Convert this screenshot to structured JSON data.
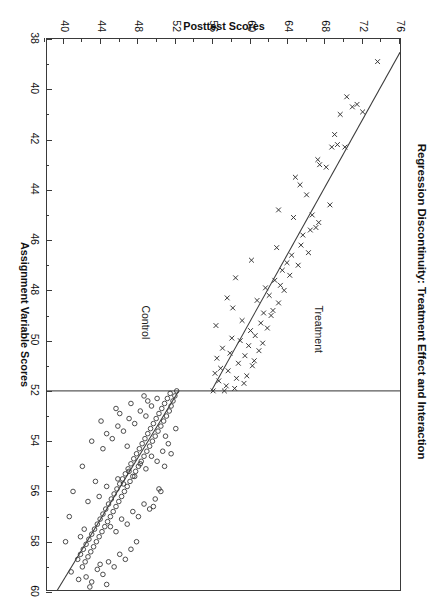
{
  "chart_data": {
    "type": "scatter",
    "title": "Regression Discontinuity: Treatment Effect and Interaction",
    "xlabel": "Assignment Variable Scores",
    "ylabel": "Posttest Scores",
    "xlim": [
      38,
      60
    ],
    "ylim": [
      38,
      76
    ],
    "xticks": [
      38,
      40,
      42,
      44,
      46,
      48,
      50,
      52,
      54,
      56,
      58,
      60
    ],
    "xticklabels": [
      "38",
      "40",
      "42",
      "44",
      "46",
      "48",
      "50",
      "52",
      "54",
      "56",
      "58",
      "60"
    ],
    "xticks_labeled": [
      38,
      40,
      42,
      44,
      46,
      48,
      50,
      52,
      54,
      56,
      58,
      60
    ],
    "yticks": [
      40,
      44,
      48,
      52,
      56,
      60,
      64,
      68,
      72,
      76
    ],
    "yticklabels": [
      "40",
      "44",
      "48",
      "52",
      "56",
      "60",
      "64",
      "68",
      "72",
      "76"
    ],
    "yticks_minor": [
      38,
      42,
      46,
      50,
      54,
      58,
      62,
      66,
      70,
      74,
      76
    ],
    "grid": false,
    "legend": "none",
    "cutoff": {
      "value": 52,
      "orientation": "vertical",
      "color": "#5a5a5a"
    },
    "annotations": [
      {
        "text": "Treatment",
        "x": 48.6,
        "y": 68.0
      },
      {
        "text": "Control",
        "x": 48.6,
        "y": 49.5
      }
    ],
    "series": [
      {
        "name": "Treatment",
        "marker": "x",
        "color": "#2e2e2e",
        "fit": {
          "type": "linear",
          "x_start": 38.0,
          "x_end": 52.0,
          "y_start": 76.8,
          "y_end": 55.8
        },
        "points": [
          [
            38.9,
            73.6
          ],
          [
            40.6,
            71.4
          ],
          [
            40.7,
            70.9
          ],
          [
            40.3,
            70.3
          ],
          [
            42.3,
            70.1
          ],
          [
            41.0,
            69.6
          ],
          [
            42.2,
            69.3
          ],
          [
            42.3,
            68.7
          ],
          [
            44.6,
            68.5
          ],
          [
            43.1,
            68.1
          ],
          [
            43.0,
            67.4
          ],
          [
            45.3,
            67.3
          ],
          [
            45.5,
            67.0
          ],
          [
            45.0,
            66.6
          ],
          [
            45.6,
            66.4
          ],
          [
            46.5,
            66.2
          ],
          [
            44.2,
            66.0
          ],
          [
            45.8,
            65.6
          ],
          [
            46.2,
            65.4
          ],
          [
            47.0,
            65.1
          ],
          [
            43.5,
            64.8
          ],
          [
            45.1,
            64.6
          ],
          [
            46.6,
            64.4
          ],
          [
            47.4,
            64.2
          ],
          [
            46.9,
            63.9
          ],
          [
            48.0,
            63.6
          ],
          [
            47.2,
            63.4
          ],
          [
            47.8,
            63.2
          ],
          [
            48.5,
            63.0
          ],
          [
            46.3,
            62.8
          ],
          [
            47.6,
            62.6
          ],
          [
            48.8,
            62.4
          ],
          [
            49.0,
            62.2
          ],
          [
            48.2,
            62.0
          ],
          [
            49.5,
            61.8
          ],
          [
            47.9,
            61.6
          ],
          [
            48.9,
            61.4
          ],
          [
            50.1,
            61.3
          ],
          [
            49.3,
            61.1
          ],
          [
            50.4,
            60.9
          ],
          [
            48.4,
            60.7
          ],
          [
            49.8,
            60.5
          ],
          [
            50.8,
            60.4
          ],
          [
            51.0,
            60.2
          ],
          [
            49.6,
            60.0
          ],
          [
            50.2,
            59.8
          ],
          [
            51.4,
            59.6
          ],
          [
            50.6,
            59.4
          ],
          [
            51.7,
            59.3
          ],
          [
            49.2,
            59.1
          ],
          [
            50.0,
            58.9
          ],
          [
            50.9,
            58.7
          ],
          [
            51.5,
            58.5
          ],
          [
            51.9,
            58.3
          ],
          [
            48.7,
            58.1
          ],
          [
            49.9,
            58.0
          ],
          [
            50.5,
            57.8
          ],
          [
            51.2,
            57.6
          ],
          [
            51.8,
            57.4
          ],
          [
            52.0,
            57.2
          ],
          [
            50.3,
            57.0
          ],
          [
            51.1,
            56.8
          ],
          [
            51.6,
            56.6
          ],
          [
            50.7,
            56.4
          ],
          [
            51.3,
            56.2
          ],
          [
            52.0,
            56.0
          ],
          [
            49.4,
            56.3
          ],
          [
            48.3,
            57.5
          ],
          [
            47.5,
            58.4
          ],
          [
            46.8,
            60.1
          ],
          [
            44.8,
            63.0
          ],
          [
            43.8,
            65.3
          ],
          [
            42.8,
            67.2
          ],
          [
            41.8,
            69.0
          ],
          [
            40.9,
            72.0
          ]
        ]
      },
      {
        "name": "Control",
        "marker": "o",
        "color": "#2e2e2e",
        "fit": {
          "type": "linear",
          "x_start": 52.0,
          "x_end": 60.0,
          "y_start": 52.3,
          "y_end": 39.2
        },
        "points": [
          [
            52.0,
            52.1
          ],
          [
            52.2,
            51.9
          ],
          [
            52.4,
            51.7
          ],
          [
            52.1,
            51.4
          ],
          [
            52.6,
            51.5
          ],
          [
            52.3,
            51.1
          ],
          [
            52.8,
            51.3
          ],
          [
            52.5,
            50.8
          ],
          [
            53.0,
            51.0
          ],
          [
            52.7,
            50.5
          ],
          [
            53.2,
            50.7
          ],
          [
            52.9,
            50.2
          ],
          [
            53.4,
            50.4
          ],
          [
            53.1,
            49.9
          ],
          [
            53.6,
            50.1
          ],
          [
            53.3,
            49.6
          ],
          [
            53.8,
            49.8
          ],
          [
            53.5,
            49.3
          ],
          [
            54.0,
            49.5
          ],
          [
            53.7,
            49.0
          ],
          [
            54.2,
            49.2
          ],
          [
            53.9,
            48.7
          ],
          [
            54.4,
            48.9
          ],
          [
            54.1,
            48.4
          ],
          [
            54.6,
            48.6
          ],
          [
            54.3,
            48.1
          ],
          [
            54.8,
            48.3
          ],
          [
            54.5,
            47.8
          ],
          [
            55.0,
            48.0
          ],
          [
            54.7,
            47.5
          ],
          [
            55.2,
            47.7
          ],
          [
            54.9,
            47.2
          ],
          [
            55.4,
            47.4
          ],
          [
            55.1,
            46.9
          ],
          [
            55.6,
            47.1
          ],
          [
            55.3,
            46.6
          ],
          [
            55.8,
            46.8
          ],
          [
            55.5,
            46.3
          ],
          [
            56.0,
            46.5
          ],
          [
            55.7,
            46.0
          ],
          [
            56.2,
            46.2
          ],
          [
            55.9,
            45.7
          ],
          [
            56.4,
            45.9
          ],
          [
            56.1,
            45.4
          ],
          [
            56.6,
            45.6
          ],
          [
            56.3,
            45.1
          ],
          [
            56.8,
            45.3
          ],
          [
            56.5,
            44.8
          ],
          [
            57.0,
            45.0
          ],
          [
            56.7,
            44.5
          ],
          [
            57.2,
            44.7
          ],
          [
            56.9,
            44.2
          ],
          [
            57.4,
            44.4
          ],
          [
            57.1,
            43.9
          ],
          [
            57.6,
            44.1
          ],
          [
            57.3,
            43.6
          ],
          [
            57.8,
            43.8
          ],
          [
            57.5,
            43.3
          ],
          [
            58.0,
            43.5
          ],
          [
            57.7,
            43.0
          ],
          [
            58.2,
            43.2
          ],
          [
            57.9,
            42.7
          ],
          [
            58.4,
            42.9
          ],
          [
            58.1,
            42.4
          ],
          [
            58.6,
            42.6
          ],
          [
            58.3,
            42.1
          ],
          [
            58.8,
            42.3
          ],
          [
            58.5,
            41.8
          ],
          [
            59.0,
            42.0
          ],
          [
            58.7,
            41.5
          ],
          [
            52.3,
            50.0
          ],
          [
            52.6,
            49.4
          ],
          [
            53.0,
            48.8
          ],
          [
            52.8,
            48.2
          ],
          [
            53.3,
            47.6
          ],
          [
            53.1,
            47.0
          ],
          [
            53.6,
            46.4
          ],
          [
            53.4,
            45.8
          ],
          [
            53.9,
            45.2
          ],
          [
            53.7,
            44.6
          ],
          [
            54.1,
            51.2
          ],
          [
            54.4,
            50.6
          ],
          [
            54.8,
            50.0
          ],
          [
            54.6,
            49.4
          ],
          [
            55.1,
            48.8
          ],
          [
            54.9,
            48.2
          ],
          [
            55.4,
            47.6
          ],
          [
            55.2,
            47.0
          ],
          [
            55.7,
            46.4
          ],
          [
            55.5,
            45.8
          ],
          [
            56.0,
            50.4
          ],
          [
            56.3,
            49.8
          ],
          [
            56.7,
            49.2
          ],
          [
            56.5,
            48.6
          ],
          [
            57.0,
            48.0
          ],
          [
            56.8,
            47.4
          ],
          [
            57.3,
            46.8
          ],
          [
            57.1,
            46.2
          ],
          [
            57.6,
            45.6
          ],
          [
            57.4,
            45.0
          ],
          [
            58.0,
            47.8
          ],
          [
            58.3,
            47.2
          ],
          [
            58.7,
            46.6
          ],
          [
            58.5,
            46.0
          ],
          [
            59.0,
            45.4
          ],
          [
            58.8,
            44.8
          ],
          [
            59.3,
            44.2
          ],
          [
            59.1,
            43.6
          ],
          [
            59.6,
            43.0
          ],
          [
            59.4,
            42.4
          ],
          [
            52.5,
            47.2
          ],
          [
            53.2,
            44.0
          ],
          [
            54.0,
            43.0
          ],
          [
            55.0,
            42.0
          ],
          [
            56.0,
            41.0
          ],
          [
            57.0,
            40.6
          ],
          [
            58.0,
            40.2
          ],
          [
            59.2,
            40.8
          ],
          [
            59.5,
            41.6
          ],
          [
            52.9,
            46.0
          ],
          [
            54.3,
            44.2
          ],
          [
            55.6,
            43.4
          ],
          [
            56.4,
            42.6
          ],
          [
            57.8,
            41.8
          ],
          [
            59.8,
            42.8
          ],
          [
            53.5,
            52.0
          ],
          [
            54.5,
            51.5
          ],
          [
            55.0,
            50.8
          ],
          [
            55.9,
            50.2
          ],
          [
            56.6,
            49.6
          ],
          [
            52.2,
            48.6
          ],
          [
            52.7,
            45.6
          ],
          [
            53.8,
            50.9
          ],
          [
            54.2,
            46.8
          ],
          [
            55.8,
            44.6
          ],
          [
            56.2,
            43.8
          ],
          [
            57.5,
            42.2
          ],
          [
            58.9,
            43.9
          ],
          [
            59.7,
            44.6
          ],
          [
            52.4,
            49.0
          ]
        ]
      }
    ]
  }
}
